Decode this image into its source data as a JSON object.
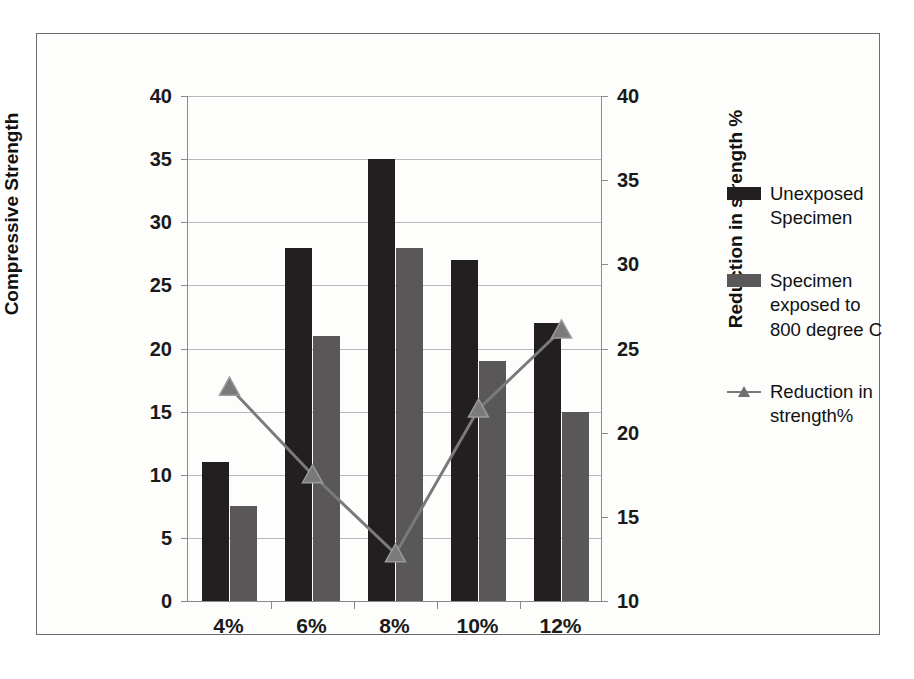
{
  "chart_data": {
    "type": "bar",
    "title": "",
    "categories": [
      "4%",
      "6%",
      "8%",
      "10%",
      "12%"
    ],
    "xlabel": "",
    "ylabel": "Compressive Strength",
    "y2label": "Reduction in strength %",
    "ylim": [
      0,
      40
    ],
    "y2lim": [
      10,
      40
    ],
    "yticks": [
      0,
      5,
      10,
      15,
      20,
      25,
      30,
      35,
      40
    ],
    "y2ticks": [
      10,
      15,
      20,
      25,
      30,
      35,
      40
    ],
    "grid": true,
    "legend_position": "right",
    "series": [
      {
        "name": "Unexposed Specimen",
        "type": "bar",
        "axis": "left",
        "color": "#231f20",
        "values": [
          11,
          28,
          35,
          27,
          22
        ]
      },
      {
        "name": "Specimen exposed to 800 degree  C",
        "type": "bar",
        "axis": "left",
        "color": "#595757",
        "values": [
          7.5,
          21,
          28,
          19,
          15
        ]
      },
      {
        "name": "Reduction in strength%",
        "type": "line",
        "axis": "right",
        "color": "#7a7a7a",
        "marker": "triangle",
        "values": [
          22.7,
          17.5,
          12.8,
          21.4,
          26.1
        ]
      }
    ]
  },
  "axes": {
    "left": {
      "title": "Compressive Strength",
      "tick_labels": [
        "40",
        "35",
        "30",
        "25",
        "20",
        "15",
        "10",
        "5",
        "0"
      ]
    },
    "right": {
      "title": "Reduction in strength %",
      "tick_labels": [
        "40",
        "35",
        "30",
        "25",
        "20",
        "15",
        "10"
      ]
    },
    "x": {
      "tick_labels": [
        "4%",
        "6%",
        "8%",
        "10%",
        "12%"
      ]
    }
  },
  "legend": {
    "entries": [
      {
        "label": "Unexposed\nSpecimen",
        "swatch": "legend-swatch-dark"
      },
      {
        "label": "Specimen\nexposed to\n800 degree  C",
        "swatch": "legend-swatch-gray"
      },
      {
        "label": "Reduction in\nstrength%",
        "swatch": "legend-marker-line"
      }
    ]
  }
}
